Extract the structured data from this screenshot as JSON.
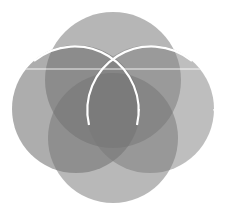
{
  "figure": {
    "description": "Four overlapping translucent gray circles forming a flower/Venn logo mark",
    "background": "#ffffff",
    "fill_color": "#6e6e6e",
    "fill_opacity": 0.55,
    "stroke_color": "#ffffff",
    "circles": [
      {
        "name": "top-circle",
        "cx": 113,
        "cy": 80,
        "r": 68
      },
      {
        "name": "left-circle",
        "cx": 76,
        "cy": 109,
        "r": 64
      },
      {
        "name": "right-circle",
        "cx": 150,
        "cy": 109,
        "r": 64
      },
      {
        "name": "bottom-circle",
        "cx": 113,
        "cy": 138,
        "r": 65
      }
    ],
    "horizontal_line_y": 69
  }
}
